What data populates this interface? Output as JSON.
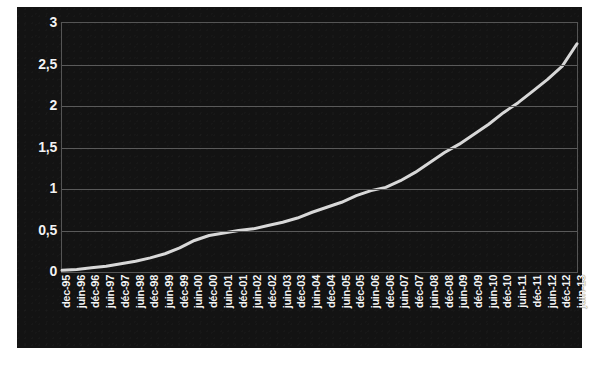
{
  "chart_data": {
    "type": "line",
    "title": "",
    "subtitle": "",
    "xlabel": "",
    "ylabel": "",
    "ylim": [
      0,
      3
    ],
    "yticks": [
      0,
      0.5,
      1,
      1.5,
      2,
      2.5,
      3
    ],
    "ytick_labels": [
      "0",
      "0,5",
      "1",
      "1,5",
      "2",
      "2,5",
      "3"
    ],
    "grid": true,
    "legend": false,
    "legend_position": "none",
    "decimal_separator": ",",
    "line_color": "#d8d8d8",
    "background_color": "#131313",
    "gridline_color": "#5a5a5a",
    "axis_text_color": "#f2f2f2",
    "categories": [
      "dec-95",
      "juin-96",
      "déc-96",
      "juin-97",
      "déc-97",
      "juin-98",
      "déc-98",
      "juin-99",
      "déc-99",
      "juin-00",
      "déc-00",
      "juin-01",
      "déc-01",
      "juin-02",
      "déc-02",
      "juin-03",
      "déc-03",
      "juin-04",
      "déc-04",
      "juin-05",
      "déc-05",
      "juin-06",
      "déc-06",
      "juin-07",
      "déc-07",
      "juin-08",
      "déc-08",
      "juin-09",
      "déc-09",
      "juin-10",
      "déc-10",
      "juin-11",
      "déc-11",
      "juin-12",
      "déc-12",
      "juin-13"
    ],
    "series": [
      {
        "name": "série 1",
        "values": [
          0.02,
          0.03,
          0.05,
          0.07,
          0.1,
          0.13,
          0.17,
          0.22,
          0.29,
          0.38,
          0.44,
          0.47,
          0.5,
          0.52,
          0.56,
          0.6,
          0.65,
          0.72,
          0.78,
          0.84,
          0.92,
          0.98,
          1.02,
          1.1,
          1.2,
          1.32,
          1.44,
          1.54,
          1.66,
          1.78,
          1.92,
          2.04,
          2.18,
          2.32,
          2.48,
          2.75
        ]
      }
    ]
  }
}
